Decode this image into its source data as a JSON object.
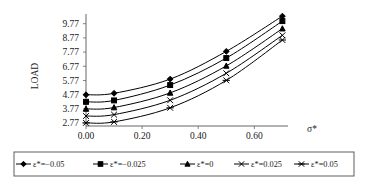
{
  "chart_data": {
    "type": "line",
    "title": "",
    "xlabel": "σ*",
    "ylabel": "LOAD",
    "x": [
      0.0,
      0.1,
      0.3,
      0.5,
      0.7
    ],
    "xlim": [
      0.0,
      0.72
    ],
    "ylim": [
      2.57,
      10.45
    ],
    "xticks": [
      "0.00",
      "0.20",
      "0.40",
      "0.60"
    ],
    "xtick_values": [
      0.0,
      0.2,
      0.4,
      0.6
    ],
    "yticks": [
      "2.77",
      "3.77",
      "4.77",
      "5.77",
      "6.77",
      "7.77",
      "8.77",
      "9.77"
    ],
    "ytick_values": [
      2.77,
      3.77,
      4.77,
      5.77,
      6.77,
      7.77,
      8.77,
      9.77
    ],
    "grid": false,
    "legend_position": "bottom",
    "series": [
      {
        "name": "ε*=−0.05",
        "marker": "diamond",
        "values": [
          4.77,
          4.87,
          5.87,
          7.82,
          10.3
        ]
      },
      {
        "name": "ε*=−0.025",
        "marker": "square",
        "values": [
          4.27,
          4.37,
          5.45,
          7.35,
          9.95
        ]
      },
      {
        "name": "ε*=0",
        "marker": "triangle",
        "values": [
          3.77,
          3.87,
          4.9,
          6.8,
          9.42
        ]
      },
      {
        "name": "ε*=0.025",
        "marker": "cross",
        "values": [
          3.27,
          3.37,
          4.38,
          6.28,
          8.95
        ]
      },
      {
        "name": "ε*=0.05",
        "marker": "star",
        "values": [
          2.79,
          2.86,
          3.85,
          5.78,
          8.62
        ]
      }
    ]
  },
  "legend": {
    "entries": [
      {
        "label": "ε*=−0.05"
      },
      {
        "label": "ε*=−0.025"
      },
      {
        "label": "ε*=0"
      },
      {
        "label": "ε*=0.025"
      },
      {
        "label": "ε*=0.05"
      }
    ]
  },
  "axes": {
    "y_title": "LOAD",
    "x_title": "σ*"
  }
}
